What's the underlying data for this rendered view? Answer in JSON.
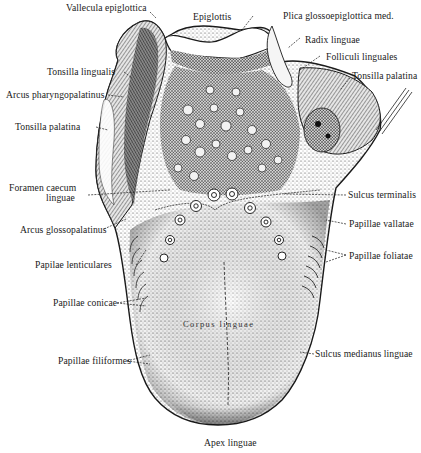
{
  "figure": {
    "style": "black-and-white stippled engraving",
    "colors": {
      "background": "#ffffff",
      "ink": "#1a1a1a"
    }
  },
  "labels": {
    "vallecula_epiglottica": "Vallecula epiglottica",
    "epiglottis": "Epiglottis",
    "plica_glossoepiglottica": "Plica glossoepiglottica med.",
    "radix_linguae": "Radix linguae",
    "folliculi_linguales": "Folliculi linguales",
    "tonsilla_palatina_right": "Tonsilla palatina",
    "tonsilla_lingualis": "Tonsilla lingualis",
    "arcus_pharyngopalatinus": "Arcus pharyngopalatinus",
    "tonsilla_palatina_left": "Tonsilla palatina",
    "foramen_caecum_line1": "Foramen caecum",
    "foramen_caecum_line2": "linguae",
    "sulcus_terminalis": "Sulcus terminalis",
    "arcus_glossopalatinus": "Arcus glossopalatinus",
    "papillae_vallatae": "Papillae vallatae",
    "papilae_lenticulares": "Papilae lenticulares",
    "papillae_foliatae": "Papillae foliatae",
    "papillae_conicae": "Papillae conicae",
    "corpus_linguae": "Corpus linguae",
    "papillae_filiformes": "Papillae filiformes",
    "sulcus_medianus_linguae": "Sulcus medianus linguae",
    "apex_linguae": "Apex linguae"
  }
}
